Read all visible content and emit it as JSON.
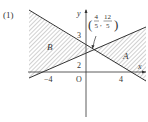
{
  "problem_label": "(1)",
  "axes": {
    "x_label": "x",
    "y_label": "y",
    "origin_label": "O"
  },
  "ticks": {
    "x_neg": "−4",
    "x_pos": "4",
    "y_2": "2",
    "y_3": "3"
  },
  "intersection": {
    "x_num": "4",
    "x_den": "5",
    "y_num": "12",
    "y_den": "5"
  },
  "regions": {
    "a": "A",
    "b": "B"
  },
  "colors": {
    "line": "#333333",
    "hatch": "#888888"
  }
}
